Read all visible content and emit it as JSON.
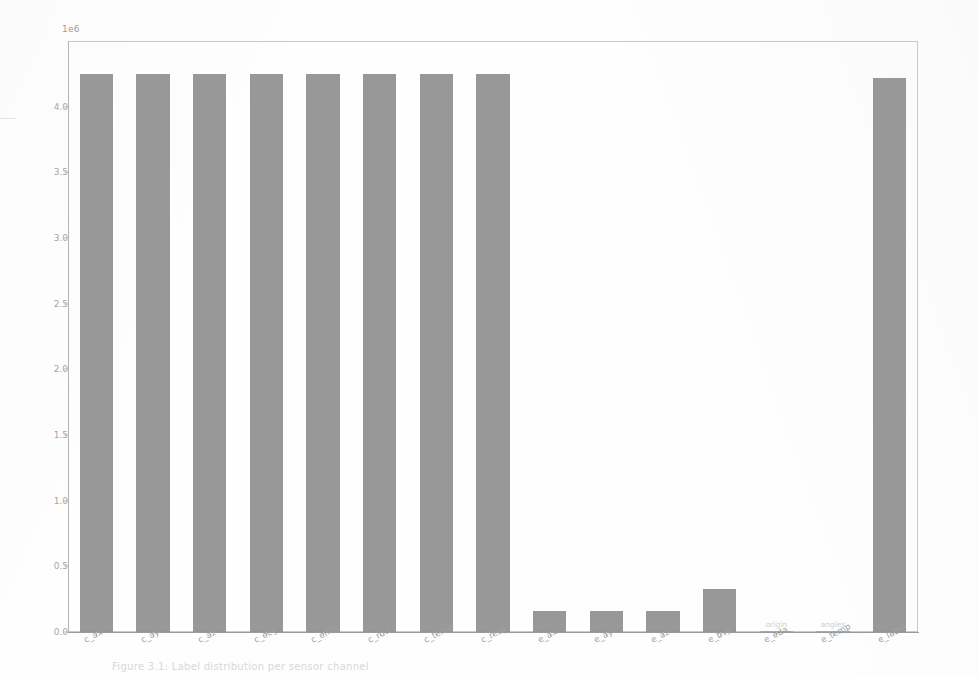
{
  "figure": {
    "offset_text": "1e6",
    "caption": "Figure 3.1: Label distribution per sensor channel",
    "bar_color": "#8f8f8f",
    "axis_color": "#b8b8b8",
    "tick_label_color": "#a0a0a0"
  },
  "chart_data": {
    "type": "bar",
    "title": "",
    "xlabel": "",
    "ylabel": "",
    "ylim": [
      0,
      4.5
    ],
    "y_multiplier": "1e6",
    "grid": false,
    "legend": false,
    "y_ticks": [
      "0.0",
      "0.5",
      "1.0",
      "1.5",
      "2.0",
      "2.5",
      "3.0",
      "3.5",
      "4.0"
    ],
    "y_tick_values": [
      0.0,
      0.5,
      1.0,
      1.5,
      2.0,
      2.5,
      3.0,
      3.5,
      4.0
    ],
    "categories": [
      "c_ax",
      "c_ay",
      "c_az",
      "c_ecg",
      "c_emg",
      "c_rda",
      "c_temp",
      "c_resp",
      "e_ax",
      "e_ay",
      "e_az",
      "e_bvp",
      "e_eda",
      "e_temp",
      "e_label"
    ],
    "values": [
      4.25,
      4.25,
      4.25,
      4.25,
      4.25,
      4.25,
      4.25,
      4.25,
      0.16,
      0.16,
      0.16,
      0.33,
      0.004,
      0.004,
      4.22
    ],
    "annotations": [
      {
        "category": "e_eda",
        "text": "origin"
      },
      {
        "category": "e_temp",
        "text": "angles"
      }
    ]
  }
}
